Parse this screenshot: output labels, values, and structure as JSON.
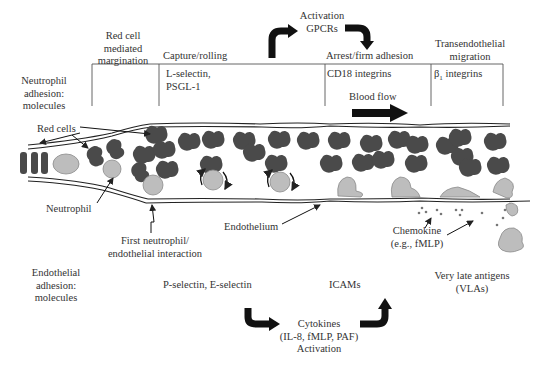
{
  "colors": {
    "red_cell": "#4a4a4a",
    "neutrophil": "#bdbdbd",
    "neutrophil_stroke": "#8a8a8a",
    "line": "#222222",
    "text": "#333333"
  },
  "header": {
    "activation_top": [
      "Activation",
      "GPCRs"
    ],
    "stages": [
      {
        "label_lines": [
          "Red cell",
          "mediated",
          "margination"
        ]
      },
      {
        "label_lines": [
          "Capture/rolling"
        ]
      },
      {
        "label_lines": [
          "Arrest/firm adhesion"
        ]
      },
      {
        "label_lines": [
          "Transendothelial",
          "migration"
        ]
      }
    ]
  },
  "neutrophil_adhesion": {
    "title_lines": [
      "Neutrophil",
      "adhesion:",
      "molecules"
    ],
    "capture": [
      "L-selectin,",
      "PSGL-1"
    ],
    "arrest": "CD18 integrins",
    "migration_prefix": "β",
    "migration_sub": "1",
    "migration_suffix": " integrins"
  },
  "blood_flow": "Blood flow",
  "annotations": {
    "red_cells": "Red cells",
    "neutrophil": "Neutrophil",
    "first_interaction": [
      "First neutrophil/",
      "endothelial interaction"
    ],
    "endothelium": "Endothelium",
    "chemokine": [
      "Chemokine",
      "(e.g., fMLP)"
    ]
  },
  "endothelial_adhesion": {
    "title_lines": [
      "Endothelial",
      "adhesion:",
      "molecules"
    ],
    "capture": "P-selectin, E-selectin",
    "arrest": "ICAMs",
    "migration": [
      "Very late antigens",
      "(VLAs)"
    ]
  },
  "activation_bottom": [
    "Cytokines",
    "(IL-8, fMLP, PAF)",
    "Activation"
  ]
}
